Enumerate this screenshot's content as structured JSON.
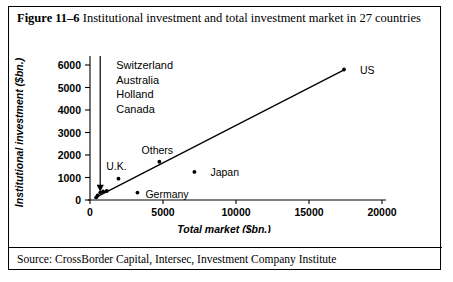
{
  "figure": {
    "number_label": "Figure 11–6",
    "caption": " Institutional investment and total investment market in 27 countries",
    "source": "Source: CrossBorder Capital, Intersec, Investment Company Institute"
  },
  "chart_data": {
    "type": "scatter",
    "title": "Institutional investment and total investment market in 27 countries",
    "xlabel": "Total market ($bn.)",
    "ylabel": "Institutional investment ($bn.)",
    "xlim": [
      0,
      20000
    ],
    "ylim": [
      0,
      6500
    ],
    "xticks": [
      "0",
      "5000",
      "10000",
      "15000",
      "20000"
    ],
    "xtick_values": [
      0,
      5000,
      10000,
      15000,
      20000
    ],
    "yticks": [
      "0",
      "1000",
      "2000",
      "3000",
      "4000",
      "5000",
      "6000"
    ],
    "ytick_values": [
      0,
      1000,
      2000,
      3000,
      4000,
      5000,
      6000
    ],
    "grid": false,
    "legend": "none",
    "points": [
      {
        "label": "US",
        "x": 17400,
        "y": 5800,
        "label_dx": 16,
        "label_dy": 4,
        "anchor": "start"
      },
      {
        "label": "Japan",
        "x": 7150,
        "y": 1250,
        "label_dx": 16,
        "label_dy": 4,
        "anchor": "start"
      },
      {
        "label": "Others",
        "x": 4750,
        "y": 1700,
        "label_dx": -2,
        "label_dy": -8,
        "anchor": "middle"
      },
      {
        "label": "Germany",
        "x": 3250,
        "y": 330,
        "label_dx": 8,
        "label_dy": 5,
        "anchor": "start"
      },
      {
        "label": "U.K.",
        "x": 1950,
        "y": 950,
        "label_dx": -2,
        "label_dy": -9,
        "anchor": "middle"
      },
      {
        "label": "",
        "x": 1150,
        "y": 400,
        "label_dx": 0,
        "label_dy": 0,
        "anchor": "start"
      },
      {
        "label": "",
        "x": 900,
        "y": 380,
        "label_dx": 0,
        "label_dy": 0,
        "anchor": "start"
      },
      {
        "label": "",
        "x": 700,
        "y": 330,
        "label_dx": 0,
        "label_dy": 0,
        "anchor": "start"
      },
      {
        "label": "",
        "x": 520,
        "y": 200,
        "label_dx": 0,
        "label_dy": 0,
        "anchor": "start"
      },
      {
        "label": "",
        "x": 430,
        "y": 120,
        "label_dx": 0,
        "label_dy": 0,
        "anchor": "start"
      }
    ],
    "trendline": {
      "x0": 300,
      "y0": 80,
      "x1": 17400,
      "y1": 5780
    },
    "annotation_arrow": {
      "tip_x": 700,
      "tip_y": 500,
      "tail_x": 700,
      "tail_y": 6400,
      "points_to": "cluster of small countries near origin"
    },
    "cluster_countries": [
      "Switzerland",
      "Australia",
      "Holland",
      "Canada"
    ]
  }
}
